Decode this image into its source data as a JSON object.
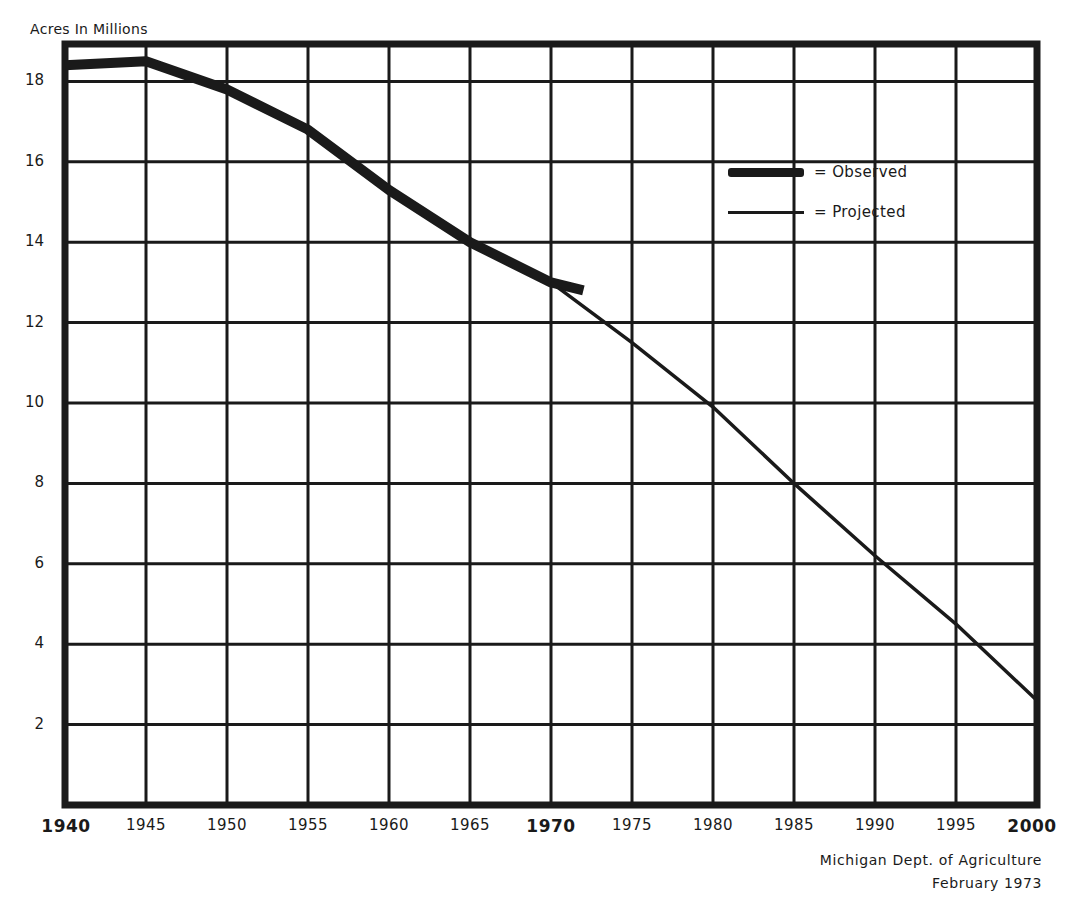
{
  "chart_data": {
    "type": "line",
    "title": "",
    "ylabel": "Acres In Millions",
    "xlabel": "",
    "xlim": [
      1940,
      2000
    ],
    "ylim": [
      0,
      19
    ],
    "grid": true,
    "legend_position": "upper right (inside plot)",
    "x_ticks": [
      "1940",
      "1945",
      "1950",
      "1955",
      "1960",
      "1965",
      "1970",
      "1975",
      "1980",
      "1985",
      "1990",
      "1995",
      "2000"
    ],
    "x_ticks_bold": [
      "1940",
      "1970",
      "2000"
    ],
    "y_ticks": [
      "2",
      "4",
      "6",
      "8",
      "10",
      "12",
      "14",
      "16",
      "18"
    ],
    "series": [
      {
        "name": "Observed",
        "legend_label": "= Observed",
        "style": "thick",
        "x": [
          1940,
          1945,
          1950,
          1955,
          1960,
          1965,
          1970,
          1972
        ],
        "values": [
          18.4,
          18.5,
          17.8,
          16.8,
          15.3,
          14.0,
          13.0,
          12.8
        ]
      },
      {
        "name": "Projected",
        "legend_label": "= Projected",
        "style": "thin",
        "x": [
          1970,
          1975,
          1980,
          1985,
          1990,
          1995,
          2000
        ],
        "values": [
          13.0,
          11.5,
          9.9,
          8.0,
          6.2,
          4.5,
          2.6
        ]
      }
    ],
    "annotations": [
      "Michigan Dept. of Agriculture",
      "February 1973"
    ]
  },
  "labels": {
    "y_axis_title": "Acres In Millions",
    "legend_observed": "= Observed",
    "legend_projected": "= Projected",
    "source_line1": "Michigan Dept. of Agriculture",
    "source_line2": "February 1973"
  },
  "colors": {
    "ink": "#1a1a1a",
    "background": "#ffffff"
  }
}
